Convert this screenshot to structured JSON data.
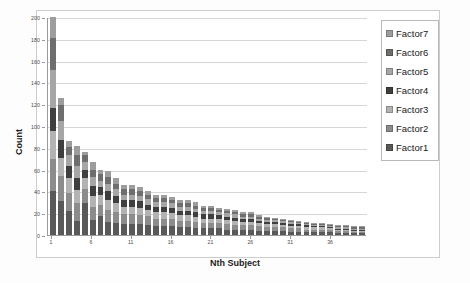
{
  "chart_data": {
    "type": "bar",
    "subtype": "stacked-column",
    "title": "",
    "xlabel": "Nth Subject",
    "ylabel": "Count",
    "ylim": [
      0,
      200
    ],
    "yticks": [
      0,
      20,
      40,
      60,
      80,
      100,
      120,
      140,
      160,
      180,
      200
    ],
    "xticks": [
      1,
      6,
      11,
      16,
      21,
      26,
      31,
      36
    ],
    "x": [
      1,
      2,
      3,
      4,
      5,
      6,
      7,
      8,
      9,
      10,
      11,
      12,
      13,
      14,
      15,
      16,
      17,
      18,
      19,
      20,
      21,
      22,
      23,
      24,
      25,
      26,
      27,
      28,
      29,
      30,
      31,
      32,
      33,
      34,
      35,
      36,
      37,
      38,
      39,
      40
    ],
    "grid": "horizontal",
    "legend_position": "right",
    "series": [
      {
        "name": "Factor1",
        "color": "#595959",
        "values": [
          40,
          31,
          22,
          13,
          29,
          14,
          17,
          12,
          11,
          10,
          10,
          10,
          9,
          8,
          8,
          8,
          7,
          7,
          6,
          6,
          6,
          6,
          5,
          5,
          5,
          5,
          4,
          4,
          4,
          4,
          3,
          3,
          3,
          3,
          3,
          3,
          2,
          2,
          2,
          2
        ]
      },
      {
        "name": "Factor2",
        "color": "#8c8c8c",
        "values": [
          30,
          23,
          17,
          16,
          13,
          12,
          11,
          11,
          10,
          9,
          9,
          8,
          8,
          7,
          7,
          7,
          6,
          6,
          6,
          5,
          5,
          5,
          5,
          4,
          4,
          4,
          4,
          3,
          3,
          3,
          3,
          3,
          2,
          2,
          2,
          2,
          2,
          2,
          1,
          1
        ]
      },
      {
        "name": "Factor3",
        "color": "#b3b3b3",
        "values": [
          25,
          17,
          13,
          12,
          10,
          10,
          9,
          9,
          8,
          7,
          7,
          7,
          6,
          6,
          6,
          5,
          5,
          5,
          5,
          4,
          4,
          4,
          4,
          4,
          3,
          3,
          3,
          3,
          3,
          2,
          2,
          2,
          2,
          2,
          2,
          1,
          1,
          1,
          1,
          1
        ]
      },
      {
        "name": "Factor4",
        "color": "#3f3f3f",
        "values": [
          22,
          16,
          11,
          11,
          8,
          9,
          7,
          8,
          7,
          6,
          6,
          6,
          5,
          5,
          5,
          5,
          4,
          4,
          4,
          4,
          4,
          3,
          3,
          3,
          3,
          3,
          2,
          2,
          2,
          2,
          2,
          2,
          2,
          1,
          1,
          1,
          1,
          1,
          1,
          1
        ]
      },
      {
        "name": "Factor5",
        "color": "#a6a6a6",
        "values": [
          34,
          18,
          10,
          11,
          7,
          8,
          6,
          7,
          6,
          5,
          5,
          5,
          5,
          4,
          4,
          4,
          4,
          4,
          3,
          3,
          3,
          3,
          3,
          3,
          2,
          2,
          2,
          2,
          2,
          2,
          2,
          1,
          1,
          1,
          1,
          1,
          1,
          1,
          1,
          1
        ]
      },
      {
        "name": "Factor6",
        "color": "#6e6e6e",
        "values": [
          30,
          14,
          8,
          10,
          6,
          7,
          6,
          6,
          5,
          5,
          5,
          4,
          4,
          4,
          4,
          3,
          3,
          3,
          3,
          3,
          3,
          2,
          2,
          2,
          2,
          2,
          2,
          2,
          1,
          1,
          1,
          1,
          1,
          1,
          1,
          1,
          1,
          1,
          1,
          1
        ]
      },
      {
        "name": "Factor7",
        "color": "#9d9d9d",
        "values": [
          19,
          7,
          5,
          9,
          3,
          7,
          4,
          6,
          5,
          4,
          4,
          4,
          3,
          3,
          3,
          3,
          3,
          3,
          3,
          2,
          2,
          2,
          2,
          2,
          2,
          2,
          1,
          1,
          1,
          1,
          1,
          1,
          1,
          1,
          1,
          1,
          1,
          1,
          1,
          1
        ]
      }
    ],
    "totals": [
      200,
      126,
      86,
      82,
      76,
      67,
      60,
      59,
      52,
      46,
      46,
      44,
      40,
      37,
      37,
      35,
      32,
      32,
      30,
      27,
      27,
      25,
      24,
      23,
      21,
      21,
      18,
      17,
      16,
      15,
      14,
      13,
      12,
      11,
      11,
      10,
      9,
      9,
      8,
      8
    ]
  },
  "legend": {
    "items": [
      {
        "label": "Factor7"
      },
      {
        "label": "Factor6"
      },
      {
        "label": "Factor5"
      },
      {
        "label": "Factor4"
      },
      {
        "label": "Factor3"
      },
      {
        "label": "Factor2"
      },
      {
        "label": "Factor1"
      }
    ]
  },
  "axes": {
    "y_title": "Count",
    "x_title": "Nth Subject"
  }
}
